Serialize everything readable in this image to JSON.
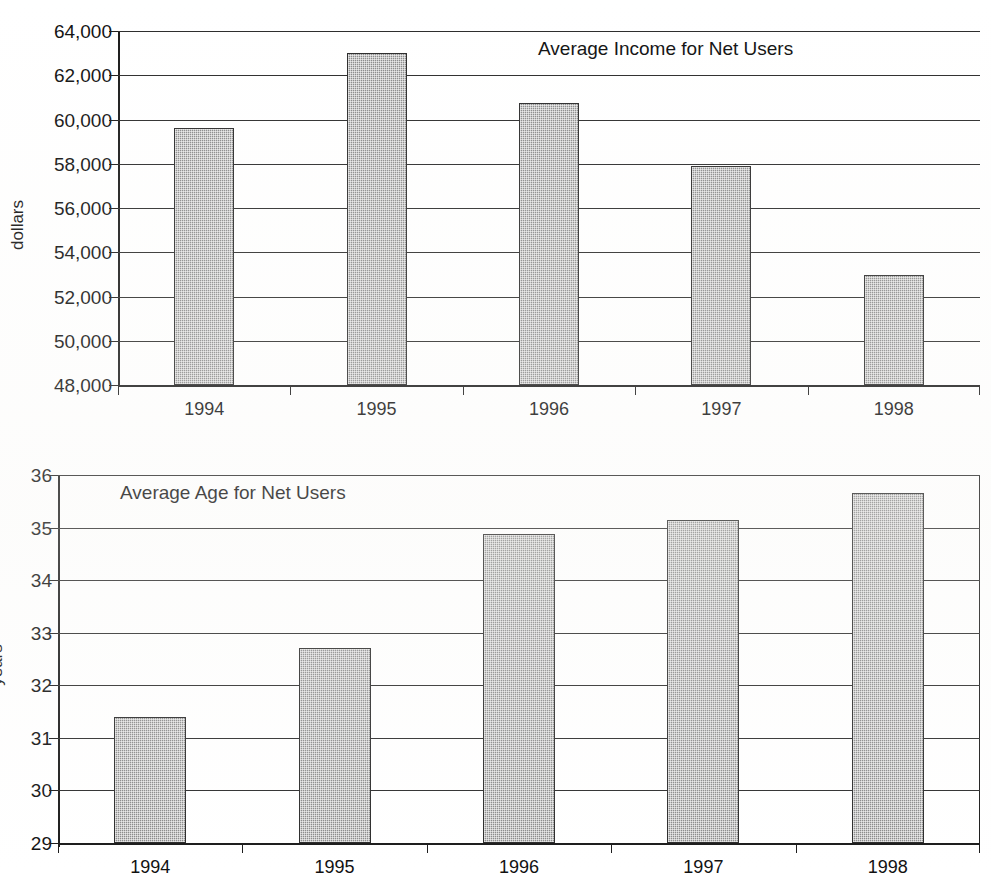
{
  "page": {
    "background": "#ffffff",
    "bar_fill": "#8a8a8a",
    "line_color": "#2b2b2b"
  },
  "chart_data": [
    {
      "id": "income",
      "type": "bar",
      "title": "Average Income for Net Users",
      "xlabel": "",
      "ylabel": "dollars",
      "categories": [
        "1994",
        "1995",
        "1996",
        "1997",
        "1998"
      ],
      "values": [
        59600,
        63000,
        60750,
        57900,
        52950
      ],
      "ylim": [
        48000,
        64000
      ],
      "ytick_values": [
        64000,
        62000,
        60000,
        58000,
        56000,
        54000,
        52000,
        50000,
        48000
      ],
      "ytick_labels": [
        "64,000",
        "62,000",
        "60,000",
        "58,000",
        "56,000",
        "54,000",
        "52,000",
        "50,000",
        "48,000"
      ],
      "grid": true,
      "legend": "none"
    },
    {
      "id": "age",
      "type": "bar",
      "title": "Average Age for Net Users",
      "xlabel": "",
      "ylabel": "years",
      "categories": [
        "1994",
        "1995",
        "1996",
        "1997",
        "1998"
      ],
      "values": [
        31.4,
        32.7,
        34.88,
        35.15,
        35.65
      ],
      "ylim": [
        29,
        36
      ],
      "ytick_values": [
        36,
        35,
        34,
        33,
        32,
        31,
        30,
        29
      ],
      "ytick_labels": [
        "36",
        "35",
        "34",
        "33",
        "32",
        "31",
        "30",
        "29"
      ],
      "grid": true,
      "legend": "none"
    }
  ]
}
